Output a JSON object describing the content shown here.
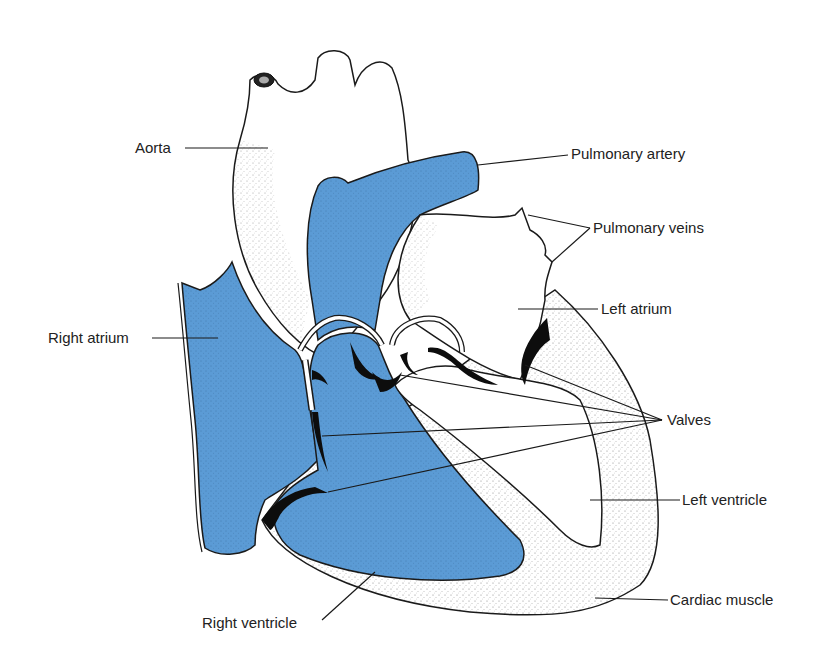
{
  "diagram": {
    "colors": {
      "deoxygenated_blue": "#5b9bd5",
      "outline": "#1a1a1a",
      "valve": "#0d0d0d",
      "background": "#ffffff"
    },
    "labels": {
      "aorta": "Aorta",
      "pulmonary_artery": "Pulmonary artery",
      "pulmonary_veins": "Pulmonary veins",
      "left_atrium": "Left atrium",
      "right_atrium": "Right atrium",
      "valves": "Valves",
      "left_ventricle": "Left ventricle",
      "cardiac_muscle": "Cardiac muscle",
      "right_ventricle": "Right ventricle"
    }
  }
}
